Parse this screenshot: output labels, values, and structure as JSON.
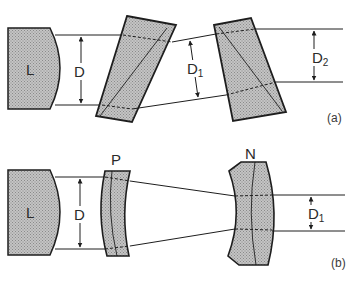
{
  "diagram": {
    "type": "optical beam expander schematic",
    "colors": {
      "ink": "#1e1e1e",
      "fill": "#b9b9b9",
      "background": "#ffffff"
    },
    "panels": [
      {
        "id": "a",
        "label": "(a)",
        "description": "Anamorphic prism pair beam expander",
        "elements": {
          "source_lens": "L",
          "input_width": "D",
          "intermediate_width": "D",
          "intermediate_width_sub": "1",
          "output_width": "D",
          "output_width_sub": "2",
          "components": [
            "prism 1",
            "prism 2"
          ]
        }
      },
      {
        "id": "b",
        "label": "(b)",
        "description": "Positive-negative lens beam reducer",
        "elements": {
          "source_lens": "L",
          "input_width": "D",
          "positive_lens": "P",
          "negative_lens": "N",
          "output_width": "D",
          "output_width_sub": "1"
        }
      }
    ]
  }
}
